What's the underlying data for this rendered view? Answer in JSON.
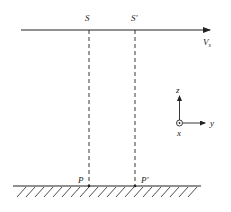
{
  "diagram": {
    "labels": {
      "source": "S",
      "source_prime": "S'",
      "velocity": "V",
      "velocity_subscript": "s",
      "point": "P",
      "point_prime": "P'"
    },
    "axes": {
      "z": "z",
      "y": "y",
      "x": "x"
    },
    "colors": {
      "line": "#222222",
      "background": "#ffffff"
    }
  }
}
